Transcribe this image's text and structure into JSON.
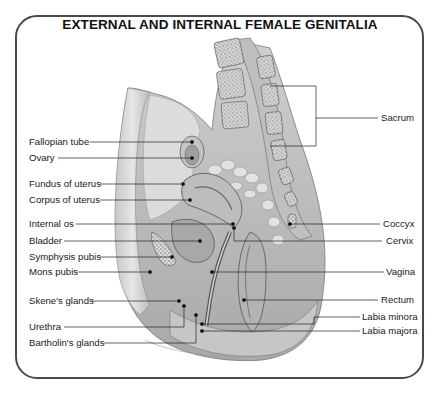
{
  "title": "EXTERNAL AND INTERNAL FEMALE GENITALIA",
  "labels_left": [
    {
      "id": "fallopian-tube",
      "text": "Fallopian tube"
    },
    {
      "id": "ovary",
      "text": "Ovary"
    },
    {
      "id": "fundus-of-uterus",
      "text": "Fundus of uterus"
    },
    {
      "id": "corpus-of-uterus",
      "text": "Corpus of uterus"
    },
    {
      "id": "internal-os",
      "text": "Internal  os"
    },
    {
      "id": "bladder",
      "text": "Bladder"
    },
    {
      "id": "symphysis-pubis",
      "text": "Symphysis pubis"
    },
    {
      "id": "mons-pubis",
      "text": "Mons pubis"
    },
    {
      "id": "skenes-glands",
      "text": "Skene's glands"
    },
    {
      "id": "urethra",
      "text": "Urethra"
    },
    {
      "id": "bartholins-glands",
      "text": "Bartholin's glands"
    }
  ],
  "labels_right": [
    {
      "id": "sacrum",
      "text": "Sacrum"
    },
    {
      "id": "coccyx",
      "text": "Coccyx"
    },
    {
      "id": "cervix",
      "text": "Cervix"
    },
    {
      "id": "vagina",
      "text": "Vagina"
    },
    {
      "id": "rectum",
      "text": "Rectum"
    },
    {
      "id": "labia-minora",
      "text": "Labia minora"
    },
    {
      "id": "labia-majora",
      "text": "Labia majora"
    }
  ],
  "colors": {
    "frame": "#4a4a4a",
    "ink": "#1a1a1a",
    "illustration_gray": "#9a9a9a"
  }
}
